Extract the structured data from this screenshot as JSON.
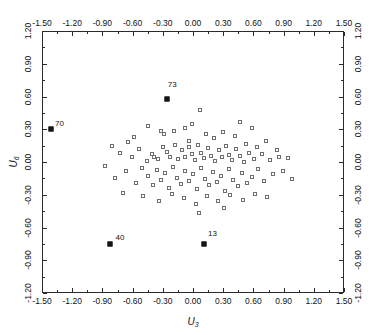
{
  "chart_data": {
    "type": "scatter",
    "title": "",
    "xlabel": "U3",
    "ylabel": "U6",
    "xlim": [
      -1.5,
      1.5
    ],
    "ylim": [
      -1.2,
      1.2
    ],
    "grid": false,
    "legend": null,
    "xticks": [
      "-1.50",
      "-1.20",
      "-0.90",
      "-0.60",
      "-0.30",
      "0.00",
      "0.30",
      "0.60",
      "0.90",
      "1.20",
      "1.50"
    ],
    "xtick_values": [
      -1.5,
      -1.2,
      -0.9,
      -0.6,
      -0.3,
      0.0,
      0.3,
      0.6,
      0.9,
      1.2,
      1.5
    ],
    "yticks": [
      "1.20",
      "0.90",
      "0.60",
      "0.30",
      "0.00",
      "-0.30",
      "-0.60",
      "-0.90",
      "-1.20"
    ],
    "ytick_values": [
      1.2,
      0.9,
      0.6,
      0.3,
      0.0,
      -0.3,
      -0.6,
      -0.9,
      -1.2
    ],
    "marker": "open-square",
    "marker_color": "#6e6e6e",
    "highlight_marker": "filled-square",
    "highlight_color": "#151515",
    "axes_color": "#2b2b2b",
    "annotations": [
      {
        "label": "70",
        "x": -1.42,
        "y": 0.31,
        "dx": 5,
        "dy": -8
      },
      {
        "label": "73",
        "x": -0.27,
        "y": 0.585,
        "dx": 2,
        "dy": -17
      },
      {
        "label": "40",
        "x": -0.83,
        "y": -0.745,
        "dx": 6,
        "dy": -9
      },
      {
        "label": "13",
        "x": 0.1,
        "y": -0.745,
        "dx": 5,
        "dy": -13
      }
    ],
    "highlighted_points": [
      {
        "label": "70",
        "x": -1.42,
        "y": 0.31
      },
      {
        "label": "73",
        "x": -0.27,
        "y": 0.585
      },
      {
        "label": "40",
        "x": -0.83,
        "y": -0.745
      },
      {
        "label": "13",
        "x": 0.1,
        "y": -0.745
      }
    ],
    "points": [
      {
        "x": -0.6,
        "y": 0.235
      },
      {
        "x": -0.46,
        "y": 0.335
      },
      {
        "x": -0.33,
        "y": 0.295
      },
      {
        "x": -0.3,
        "y": 0.265
      },
      {
        "x": -0.2,
        "y": 0.295
      },
      {
        "x": -0.09,
        "y": 0.325
      },
      {
        "x": -0.02,
        "y": 0.355
      },
      {
        "x": 0.06,
        "y": 0.485
      },
      {
        "x": 0.12,
        "y": 0.265
      },
      {
        "x": 0.2,
        "y": 0.225
      },
      {
        "x": 0.29,
        "y": 0.285
      },
      {
        "x": 0.41,
        "y": 0.245
      },
      {
        "x": 0.52,
        "y": 0.175
      },
      {
        "x": 0.63,
        "y": 0.145
      },
      {
        "x": -0.74,
        "y": 0.095
      },
      {
        "x": -0.62,
        "y": 0.055
      },
      {
        "x": -0.55,
        "y": 0.125
      },
      {
        "x": -0.47,
        "y": 0.015
      },
      {
        "x": -0.42,
        "y": 0.085
      },
      {
        "x": -0.4,
        "y": 0.055
      },
      {
        "x": -0.36,
        "y": 0.035
      },
      {
        "x": -0.31,
        "y": 0.145
      },
      {
        "x": -0.27,
        "y": 0.105
      },
      {
        "x": -0.24,
        "y": 0.055
      },
      {
        "x": -0.19,
        "y": 0.165
      },
      {
        "x": -0.16,
        "y": 0.035
      },
      {
        "x": -0.12,
        "y": 0.115
      },
      {
        "x": -0.09,
        "y": 0.055
      },
      {
        "x": -0.05,
        "y": 0.145
      },
      {
        "x": -0.02,
        "y": 0.085
      },
      {
        "x": 0.01,
        "y": 0.025
      },
      {
        "x": 0.04,
        "y": 0.165
      },
      {
        "x": 0.07,
        "y": 0.095
      },
      {
        "x": 0.1,
        "y": 0.045
      },
      {
        "x": 0.14,
        "y": 0.135
      },
      {
        "x": 0.17,
        "y": 0.065
      },
      {
        "x": 0.21,
        "y": 0.015
      },
      {
        "x": 0.25,
        "y": 0.115
      },
      {
        "x": 0.28,
        "y": 0.055
      },
      {
        "x": 0.32,
        "y": 0.155
      },
      {
        "x": 0.35,
        "y": 0.075
      },
      {
        "x": 0.38,
        "y": 0.025
      },
      {
        "x": 0.42,
        "y": 0.125
      },
      {
        "x": 0.46,
        "y": 0.065
      },
      {
        "x": 0.5,
        "y": 0.005
      },
      {
        "x": 0.55,
        "y": 0.095
      },
      {
        "x": 0.6,
        "y": 0.035
      },
      {
        "x": 0.68,
        "y": 0.085
      },
      {
        "x": 0.75,
        "y": 0.025
      },
      {
        "x": 0.84,
        "y": 0.055
      },
      {
        "x": -0.88,
        "y": -0.025
      },
      {
        "x": -0.78,
        "y": -0.135
      },
      {
        "x": -0.68,
        "y": -0.075
      },
      {
        "x": -0.58,
        "y": -0.185
      },
      {
        "x": -0.52,
        "y": -0.045
      },
      {
        "x": -0.46,
        "y": -0.115
      },
      {
        "x": -0.41,
        "y": -0.205
      },
      {
        "x": -0.37,
        "y": -0.065
      },
      {
        "x": -0.33,
        "y": -0.155
      },
      {
        "x": -0.29,
        "y": -0.095
      },
      {
        "x": -0.25,
        "y": -0.225
      },
      {
        "x": -0.21,
        "y": -0.035
      },
      {
        "x": -0.17,
        "y": -0.135
      },
      {
        "x": -0.13,
        "y": -0.195
      },
      {
        "x": -0.09,
        "y": -0.075
      },
      {
        "x": -0.05,
        "y": -0.165
      },
      {
        "x": -0.01,
        "y": -0.105
      },
      {
        "x": 0.03,
        "y": -0.235
      },
      {
        "x": 0.07,
        "y": -0.045
      },
      {
        "x": 0.11,
        "y": -0.145
      },
      {
        "x": 0.15,
        "y": -0.205
      },
      {
        "x": 0.19,
        "y": -0.085
      },
      {
        "x": 0.23,
        "y": -0.175
      },
      {
        "x": 0.27,
        "y": -0.115
      },
      {
        "x": 0.31,
        "y": -0.255
      },
      {
        "x": 0.35,
        "y": -0.055
      },
      {
        "x": 0.39,
        "y": -0.155
      },
      {
        "x": 0.44,
        "y": -0.215
      },
      {
        "x": 0.48,
        "y": -0.095
      },
      {
        "x": 0.53,
        "y": -0.185
      },
      {
        "x": 0.58,
        "y": -0.125
      },
      {
        "x": 0.64,
        "y": -0.055
      },
      {
        "x": 0.7,
        "y": -0.165
      },
      {
        "x": 0.78,
        "y": -0.105
      },
      {
        "x": 0.88,
        "y": -0.075
      },
      {
        "x": 0.97,
        "y": -0.145
      },
      {
        "x": -0.71,
        "y": -0.275
      },
      {
        "x": -0.51,
        "y": -0.305
      },
      {
        "x": -0.35,
        "y": -0.345
      },
      {
        "x": -0.22,
        "y": -0.285
      },
      {
        "x": -0.1,
        "y": -0.325
      },
      {
        "x": 0.02,
        "y": -0.375
      },
      {
        "x": 0.13,
        "y": -0.305
      },
      {
        "x": 0.24,
        "y": -0.345
      },
      {
        "x": 0.36,
        "y": -0.295
      },
      {
        "x": 0.49,
        "y": -0.335
      },
      {
        "x": 0.61,
        "y": -0.285
      },
      {
        "x": 0.73,
        "y": -0.315
      },
      {
        "x": 0.05,
        "y": -0.455
      },
      {
        "x": 0.3,
        "y": -0.415
      },
      {
        "x": 0.46,
        "y": 0.375
      },
      {
        "x": 0.58,
        "y": 0.325
      },
      {
        "x": -0.05,
        "y": 0.205
      },
      {
        "x": 0.72,
        "y": 0.205
      },
      {
        "x": 0.82,
        "y": 0.115
      },
      {
        "x": 0.93,
        "y": 0.045
      },
      {
        "x": -0.66,
        "y": 0.195
      },
      {
        "x": -0.81,
        "y": 0.155
      }
    ]
  }
}
